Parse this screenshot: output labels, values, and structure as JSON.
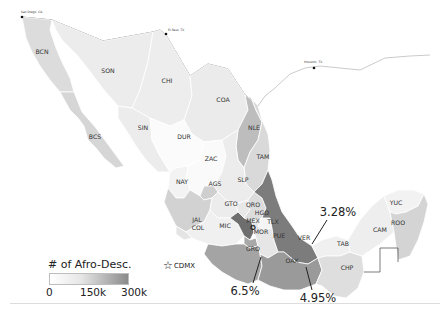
{
  "map": {
    "title": "Afro-descendant population by Mexican state",
    "colors": {
      "very_light": "#f1f1f1",
      "light": "#e2e2e2",
      "medium_light": "#cfcfcf",
      "medium": "#b4b4b4",
      "medium_dark": "#999999",
      "dark": "#7a7a7a",
      "darkest": "#626262",
      "white_region": "#fbfbfb",
      "border": "#555555"
    },
    "cities": [
      {
        "name": "San Diego, CA"
      },
      {
        "name": "El Paso, TX"
      },
      {
        "name": "Houston, TX"
      }
    ],
    "states": [
      {
        "code": "BCN"
      },
      {
        "code": "SON"
      },
      {
        "code": "CHI"
      },
      {
        "code": "COA"
      },
      {
        "code": "NLE"
      },
      {
        "code": "TAM"
      },
      {
        "code": "BCS"
      },
      {
        "code": "SIN"
      },
      {
        "code": "DUR"
      },
      {
        "code": "ZAC"
      },
      {
        "code": "SLP"
      },
      {
        "code": "NAY"
      },
      {
        "code": "AGS"
      },
      {
        "code": "GTO"
      },
      {
        "code": "QRO"
      },
      {
        "code": "HGO"
      },
      {
        "code": "JAL"
      },
      {
        "code": "MEX"
      },
      {
        "code": "TLX"
      },
      {
        "code": "MIC"
      },
      {
        "code": "COL"
      },
      {
        "code": "MOR"
      },
      {
        "code": "PUE"
      },
      {
        "code": "VER"
      },
      {
        "code": "GRO"
      },
      {
        "code": "OAX"
      },
      {
        "code": "TAB"
      },
      {
        "code": "CHP"
      },
      {
        "code": "CAM"
      },
      {
        "code": "YUC"
      },
      {
        "code": "ROO"
      }
    ],
    "callouts": [
      {
        "state": "VER",
        "value": "3.28%"
      },
      {
        "state": "GRO",
        "value": "6.5%"
      },
      {
        "state": "OAX",
        "value": "4.95%"
      }
    ]
  },
  "legend": {
    "title": "# of Afro-Desc.",
    "ticks": [
      "0",
      "150k",
      "300k"
    ],
    "marker_label": "CDMX",
    "marker_icon": "star-icon"
  }
}
